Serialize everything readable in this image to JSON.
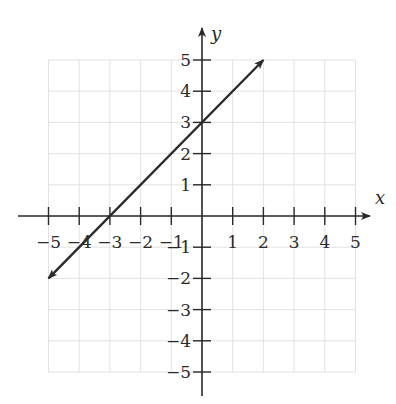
{
  "chart_data": {
    "type": "line",
    "title": "",
    "xlabel": "x",
    "ylabel": "y",
    "xlim": [
      -5,
      5
    ],
    "ylim": [
      -5,
      5
    ],
    "grid": true,
    "x_ticks": [
      -5,
      -4,
      -3,
      -2,
      -1,
      1,
      2,
      3,
      4,
      5
    ],
    "y_ticks": [
      5,
      4,
      3,
      2,
      1,
      -1,
      -2,
      -3,
      -4,
      -5
    ],
    "x_tick_labels": [
      "−5",
      "−4",
      "−3",
      "−2",
      "−1",
      "1",
      "2",
      "3",
      "4",
      "5"
    ],
    "y_tick_labels": [
      "5",
      "4",
      "3",
      "2",
      "1",
      "−1",
      "−2",
      "−3",
      "−4",
      "−5"
    ],
    "series": [
      {
        "name": "y = x + 3",
        "x": [
          -5,
          2
        ],
        "y": [
          -2,
          5
        ],
        "arrows_both_ends": true,
        "color": "#2b2b2b"
      }
    ],
    "legend": null
  },
  "colors": {
    "axis": "#2a2a2a",
    "grid": "#e2e2e2",
    "line": "#2b2b2b"
  }
}
